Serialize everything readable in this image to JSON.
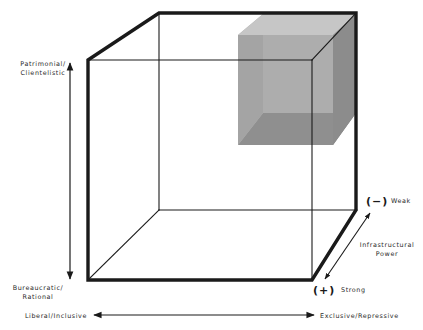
{
  "figure": {
    "type": "3d-cube-typology",
    "colors": {
      "line": "#1a1a1a",
      "background": "#ffffff",
      "subcube_light": "#c9c9c9",
      "subcube_mid": "#9e9e9e",
      "subcube_dark": "#6f6f6f"
    }
  },
  "axes": {
    "vertical": {
      "top_label_line1": "Patrimonial/",
      "top_label_line2": "Clientelistic",
      "bottom_label_line1": "Bureaucratic/",
      "bottom_label_line2": "Rational"
    },
    "horizontal": {
      "left_label": "Liberal/Inclusive",
      "right_label": "Exclusive/Repressive"
    },
    "depth": {
      "title_line1": "Infrastructural",
      "title_line2": "Power",
      "back_sign": "(−)",
      "back_label": "Weak",
      "front_sign": "(+)",
      "front_label": "Strong"
    }
  },
  "highlighted_region": {
    "position": "top-right-back octant",
    "meaning": "Patrimonial/Clientelistic, Exclusive/Repressive, Weak infrastructural power"
  }
}
